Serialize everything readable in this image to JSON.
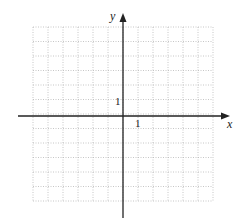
{
  "diagram": {
    "type": "coordinate-grid",
    "grid": {
      "cols": 12,
      "rows": 12,
      "line_style": "dotted",
      "line_color": "#b8b8b8"
    },
    "axes": {
      "x_label": "x",
      "y_label": "y",
      "axis_color": "#222222"
    },
    "ticks": {
      "x_unit_label": "1",
      "y_unit_label": "1"
    }
  }
}
